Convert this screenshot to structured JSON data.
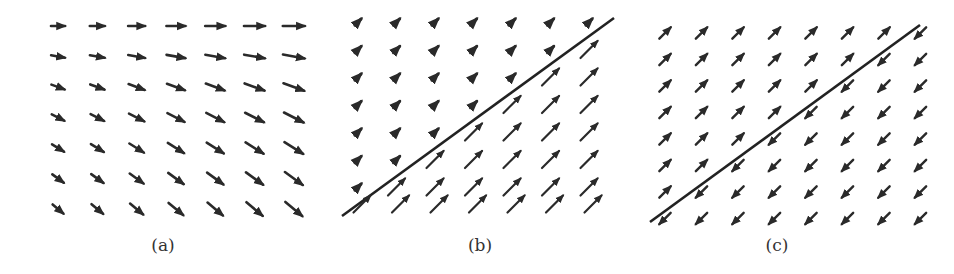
{
  "figure": {
    "captions": [
      "(a)",
      "(b)",
      "(c)"
    ],
    "colors": {
      "arrow": "#2a2a2a",
      "line": "#222222",
      "caption": "#333333",
      "background": "#ffffff"
    }
  },
  "chart_data": [
    {
      "type": "vector_field",
      "title": "(a)",
      "grid": {
        "cols": 7,
        "rows": 7,
        "x0": 58,
        "dx": 39.3,
        "y0": 26,
        "dy": 30.5
      },
      "arrows": {
        "rule": "direction rotates from horizontal (top row) to ~40 deg downward (bottom row); all point right/down-right; length grows left to right",
        "angle_deg_by_row": [
          0,
          10,
          20,
          27,
          32,
          36,
          40
        ],
        "length_by_col": [
          14,
          15,
          17,
          19,
          20,
          21,
          22
        ]
      },
      "separator_line": null
    },
    {
      "type": "vector_field",
      "title": "(b)",
      "grid": {
        "cols": 7,
        "rows": 7,
        "x0": 358,
        "dx": 38.5,
        "y0": 22,
        "dy": 27.5,
        "extra_bottom_row_y": 204
      },
      "separator_line": {
        "x1": 342,
        "y1": 216,
        "x2": 614,
        "y2": 18
      },
      "arrows": {
        "rule": "all arrows point up-right (~-45 deg); above separator short, below separator long",
        "angle_deg": -45,
        "length_above": 9,
        "length_below": 24
      }
    },
    {
      "type": "vector_field",
      "title": "(c)",
      "grid": {
        "cols": 8,
        "rows": 8,
        "x0": 665,
        "dx": 36.5,
        "y0": 33,
        "dy": 26.5
      },
      "separator_line": {
        "x1": 650,
        "y1": 222,
        "x2": 920,
        "y2": 25
      },
      "arrows": {
        "rule": "above separator arrows point up-right; below separator arrows point down-left",
        "angle_deg_above": -45,
        "angle_deg_below": 135,
        "length": 16
      }
    }
  ]
}
